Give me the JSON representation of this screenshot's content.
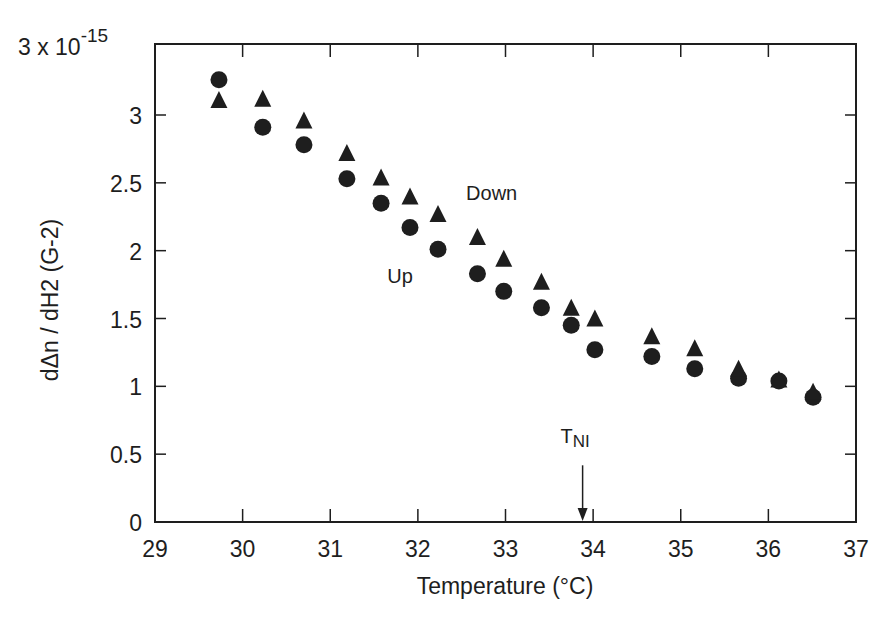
{
  "chart_data": {
    "type": "scatter",
    "title": "",
    "xlabel": "Temperature  (°C)",
    "ylabel": "dΔn / dH2   (G-2)",
    "y_multiplier_label": {
      "base": "3 x 10",
      "exponent": "-15"
    },
    "xlim": [
      29,
      37
    ],
    "ylim": [
      0,
      3.3
    ],
    "x_ticks": [
      29,
      30,
      31,
      32,
      33,
      34,
      35,
      36,
      37
    ],
    "x_tick_labels": [
      "29",
      "30",
      "31",
      "32",
      "33",
      "34",
      "35",
      "36",
      "37"
    ],
    "y_ticks": [
      0,
      0.5,
      1,
      1.5,
      2,
      2.5,
      3
    ],
    "y_tick_labels": [
      "0",
      "0.5",
      "1",
      "1.5",
      "2",
      "2.5",
      "3"
    ],
    "grid": false,
    "legend": null,
    "series": [
      {
        "name": "Up",
        "marker": "circle",
        "color": "#1e1e1e",
        "x": [
          29.73,
          30.23,
          30.7,
          31.19,
          31.58,
          31.91,
          32.23,
          32.68,
          32.98,
          33.41,
          33.75,
          34.02,
          34.67,
          35.16,
          35.66,
          36.12,
          36.51
        ],
        "y": [
          3.26,
          2.91,
          2.78,
          2.53,
          2.35,
          2.17,
          2.01,
          1.83,
          1.7,
          1.58,
          1.45,
          1.27,
          1.22,
          1.13,
          1.06,
          1.04,
          0.92
        ]
      },
      {
        "name": "Down",
        "marker": "triangle",
        "color": "#1e1e1e",
        "x": [
          29.73,
          30.23,
          30.7,
          31.19,
          31.58,
          31.91,
          32.23,
          32.68,
          32.98,
          33.41,
          33.75,
          34.02,
          34.67,
          35.16,
          35.66,
          36.12,
          36.51
        ],
        "y": [
          3.11,
          3.12,
          2.96,
          2.72,
          2.54,
          2.4,
          2.27,
          2.1,
          1.94,
          1.77,
          1.58,
          1.5,
          1.37,
          1.28,
          1.13,
          1.05,
          0.96
        ]
      }
    ],
    "annotations": [
      {
        "text": "Up",
        "x": 31.65,
        "y": 1.76
      },
      {
        "text": "Down",
        "x": 32.55,
        "y": 2.37
      },
      {
        "text": "T",
        "subscript": "NI",
        "x": 33.88,
        "y": 0.58,
        "arrow_to": {
          "x": 33.88,
          "y": 0.0
        }
      }
    ]
  }
}
